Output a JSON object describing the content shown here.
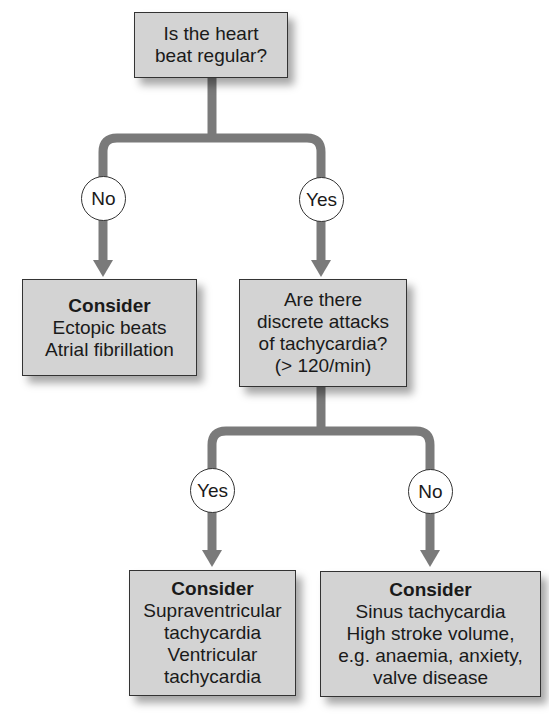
{
  "diagram": {
    "type": "flowchart",
    "colors": {
      "box_fill": "#d3d3d3",
      "connector": "#7a7a7a",
      "border": "#333333"
    },
    "root": {
      "lines": [
        "Is the heart",
        "beat regular?"
      ]
    },
    "branch1": {
      "no_label": "No",
      "yes_label": "Yes",
      "no_result": {
        "title": "Consider",
        "lines": [
          "Ectopic beats",
          "Atrial fibrillation"
        ]
      },
      "yes_question": {
        "lines": [
          "Are there",
          "discrete attacks",
          "of tachycardia?",
          "(> 120/min)"
        ]
      }
    },
    "branch2": {
      "yes_label": "Yes",
      "no_label": "No",
      "yes_result": {
        "title": "Consider",
        "lines": [
          "Supraventricular",
          "tachycardia",
          "Ventricular",
          "tachycardia"
        ]
      },
      "no_result": {
        "title": "Consider",
        "lines": [
          "Sinus tachycardia",
          "High stroke volume,",
          "e.g. anaemia, anxiety,",
          "valve disease"
        ]
      }
    }
  }
}
